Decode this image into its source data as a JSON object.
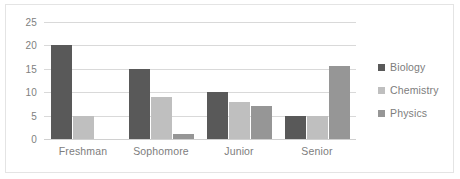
{
  "chart_data": {
    "type": "bar",
    "title": "",
    "subtitle": "",
    "xlabel": "",
    "ylabel": "",
    "categories": [
      "Freshman",
      "Sophomore",
      "Junior",
      "Senior"
    ],
    "series": [
      {
        "name": "Biology",
        "color": "#595959",
        "values": [
          20,
          15,
          10,
          5
        ]
      },
      {
        "name": "Chemistry",
        "color": "#bfbfbf",
        "values": [
          5,
          9,
          8,
          5
        ]
      },
      {
        "name": "Physics",
        "color": "#969696",
        "values": [
          0,
          1,
          7,
          15.5
        ]
      }
    ],
    "ylim": [
      0,
      25
    ],
    "ytick_labels": [
      "25",
      "20",
      "15",
      "10",
      "5",
      "0"
    ],
    "ytick_values": [
      25,
      20,
      15,
      10,
      5,
      0
    ],
    "grid": true,
    "grid_color": "#d9d9d9",
    "legend_position": "right",
    "plot_background": "#ffffff",
    "border_color": "#e4e4e4"
  }
}
